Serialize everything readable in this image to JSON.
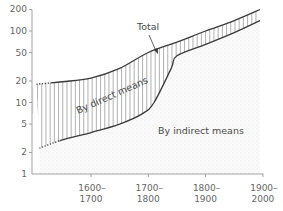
{
  "chart_data": {
    "type": "area",
    "title": "",
    "xlabel": "",
    "ylabel": "",
    "yscale": "log",
    "ylim": [
      1,
      200
    ],
    "y_ticks": [
      1,
      2,
      5,
      10,
      20,
      50,
      100,
      200
    ],
    "y_tick_labels": [
      "1",
      "2",
      "5",
      "10",
      "20",
      "50",
      "100",
      "200"
    ],
    "x_range": [
      1500,
      1980
    ],
    "x_ticks": [
      1650,
      1750,
      1850,
      1950
    ],
    "x_tick_labels": [
      [
        "1600–",
        "1700"
      ],
      [
        "1700–",
        "1800"
      ],
      [
        "1800–",
        "1900"
      ],
      [
        "1900–",
        "2000"
      ]
    ],
    "grid": false,
    "series": [
      {
        "name": "Total",
        "x": [
          1555,
          1600,
          1650,
          1700,
          1750,
          1800,
          1850,
          1900,
          1945
        ],
        "values": [
          18,
          19.5,
          22,
          30,
          50,
          70,
          100,
          140,
          200
        ],
        "dotted_until": 1580
      },
      {
        "name": "By indirect means",
        "x": [
          1560,
          1600,
          1650,
          1700,
          1740,
          1760,
          1790,
          1800,
          1850,
          1900,
          1945
        ],
        "values": [
          2.3,
          3,
          3.8,
          5,
          7,
          10,
          30,
          45,
          65,
          95,
          140
        ],
        "dotted_until": 1595
      }
    ],
    "annotations": {
      "total_label": "Total",
      "direct_region_label": "By direct means",
      "indirect_region_label": "By indirect means"
    },
    "colors": {
      "line": "#3a3a3a",
      "hatch": "#7a7a7a",
      "stipple": "#d9d9d9",
      "axis": "#8a8a8a"
    }
  }
}
